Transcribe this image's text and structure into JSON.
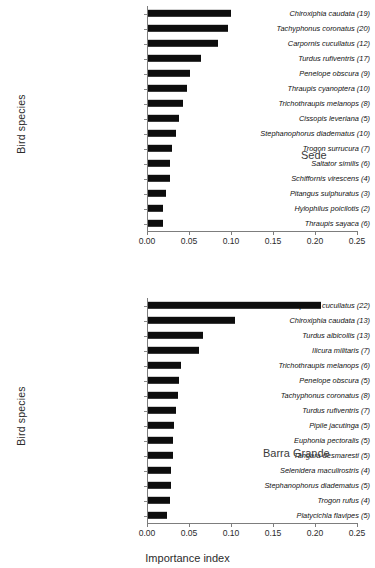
{
  "figure": {
    "xlabel": "Importance index",
    "ylabel": "Bird species"
  },
  "chart_data": [
    {
      "type": "bar",
      "orientation": "horizontal",
      "title": "Sede",
      "site_label": "Sede",
      "xlabel": "",
      "ylabel": "Bird species",
      "xlim": [
        0.0,
        0.25
      ],
      "xticks": [
        "0.00",
        "0.05",
        "0.10",
        "0.15",
        "0.20",
        "0.25"
      ],
      "xtick_values": [
        0.0,
        0.05,
        0.1,
        0.15,
        0.2,
        0.25
      ],
      "grid": false,
      "legend": "none",
      "categories": [
        "Chiroxiphia caudata (19)",
        "Tachyphonus coronatus (20)",
        "Carpornis cucullatus (12)",
        "Turdus rufiventris (17)",
        "Penelope obscura (9)",
        "Thraupis cyanoptera (10)",
        "Trichothraupis melanops (8)",
        "Cissopis leveriana (5)",
        "Stephanophorus diadematus (10)",
        "Trogon surrucura (7)",
        "Saltator similis (6)",
        "Schiffornis virescens (4)",
        "Pitangus sulphuratus (3)",
        "Hylophilus poicilotis (2)",
        "Thraupis sayaca (6)"
      ],
      "values": [
        0.1,
        0.096,
        0.085,
        0.064,
        0.051,
        0.048,
        0.043,
        0.038,
        0.035,
        0.03,
        0.027,
        0.027,
        0.023,
        0.019,
        0.019
      ]
    },
    {
      "type": "bar",
      "orientation": "horizontal",
      "title": "Barra Grande",
      "site_label": "Barra Grande",
      "xlabel": "Importance index",
      "ylabel": "Bird species",
      "xlim": [
        0.0,
        0.25
      ],
      "xticks": [
        "0.00",
        "0.05",
        "0.10",
        "0.15",
        "0.20",
        "0.25"
      ],
      "xtick_values": [
        0.0,
        0.05,
        0.1,
        0.15,
        0.2,
        0.25
      ],
      "grid": false,
      "legend": "none",
      "categories": [
        "Carpornis cucullatus (22)",
        "Chiroxiphia caudata (13)",
        "Turdus albicollis (13)",
        "Ilicura militaris (7)",
        "Trichothraupis melanops (6)",
        "Penelope obscura (5)",
        "Tachyphonus coronatus (8)",
        "Turdus rufiventris (7)",
        "Pipile jacutinga (5)",
        "Euphonia pectoralis (5)",
        "Tangara desmaresti (5)",
        "Selenidera maculirostris (4)",
        "Stephanophorus diadematus (5)",
        "Trogon rufus (4)",
        "Platycichla flavipes (5)"
      ],
      "values": [
        0.207,
        0.105,
        0.067,
        0.062,
        0.04,
        0.038,
        0.037,
        0.034,
        0.032,
        0.031,
        0.031,
        0.029,
        0.029,
        0.027,
        0.024
      ]
    }
  ]
}
